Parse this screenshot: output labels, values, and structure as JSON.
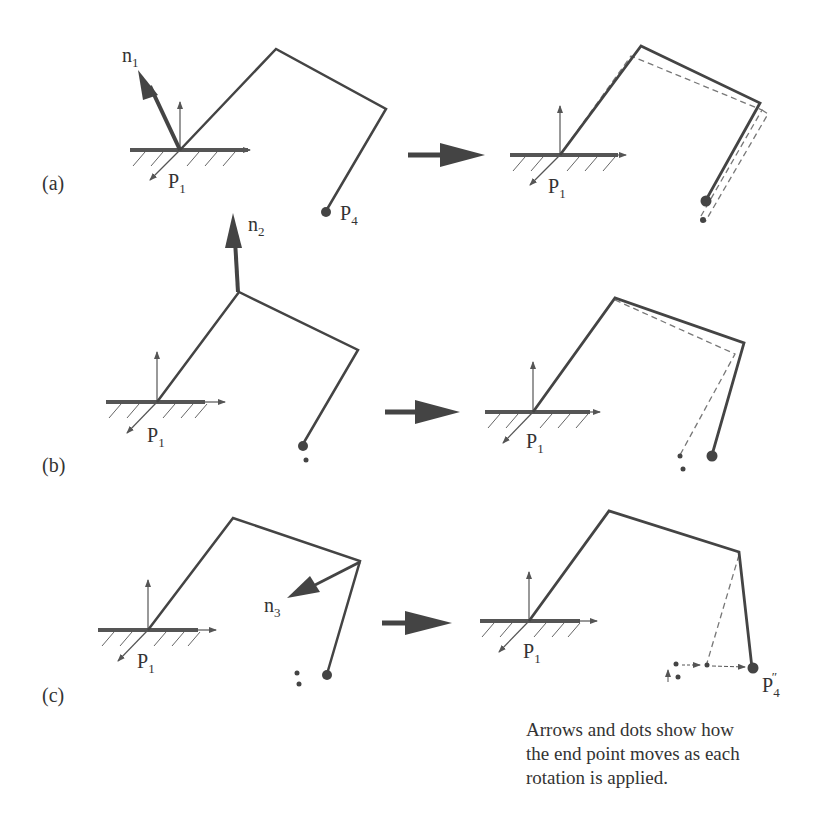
{
  "figure": {
    "panels": [
      {
        "id": "a",
        "label": "(a)",
        "normal_label": "n",
        "normal_sub": "1",
        "base_label": "P",
        "base_sub": "1",
        "end_label": "P",
        "end_sub": "4",
        "result_base_label": "P",
        "result_base_sub": "1"
      },
      {
        "id": "b",
        "label": "(b)",
        "normal_label": "n",
        "normal_sub": "2",
        "base_label": "P",
        "base_sub": "1",
        "result_base_label": "P",
        "result_base_sub": "1"
      },
      {
        "id": "c",
        "label": "(c)",
        "normal_label": "n",
        "normal_sub": "3",
        "base_label": "P",
        "base_sub": "1",
        "result_base_label": "P",
        "result_base_sub": "1",
        "final_label": "P",
        "final_sub": "4",
        "final_sup": "″"
      }
    ],
    "caption": [
      "Arrows and dots show how",
      "the end point moves as each",
      "rotation is applied."
    ],
    "colors": {
      "line": "#444444",
      "dashed": "#777777",
      "text": "#333333"
    }
  }
}
